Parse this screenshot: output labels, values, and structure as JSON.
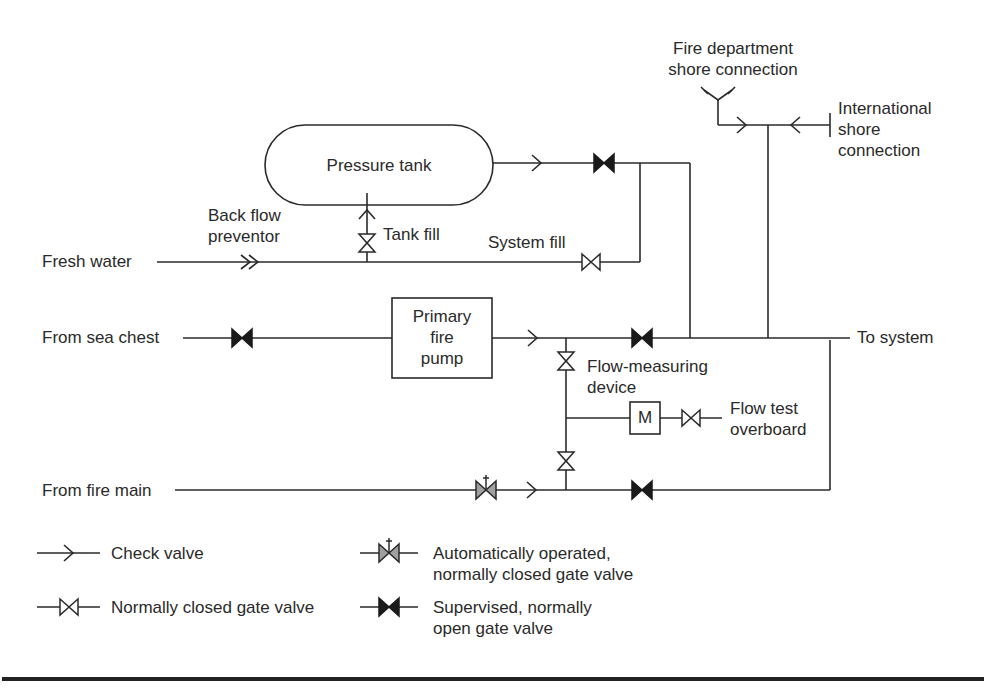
{
  "diagram": {
    "type": "piping-schematic",
    "title": "",
    "colors": {
      "line": "#2a2a2a",
      "supervised_valve_fill": "#1a1a1a",
      "auto_valve_fill": "#a0a0a0",
      "background": "#ffffff"
    },
    "components": {
      "pressure_tank": "Pressure tank",
      "primary_fire_pump": "Primary\nfire\npump",
      "meter": "M"
    },
    "labels": {
      "fire_dept_shore": "Fire department\nshore connection",
      "international_shore": "International\nshore\nconnection",
      "back_flow_preventor": "Back flow\npreventor",
      "tank_fill": "Tank fill",
      "system_fill": "System fill",
      "fresh_water": "Fresh water",
      "from_sea_chest": "From sea chest",
      "to_system": "To system",
      "flow_measuring_device": "Flow-measuring\ndevice",
      "flow_test_overboard": "Flow test\noverboard",
      "from_fire_main": "From fire main"
    },
    "legend": [
      {
        "icon": "check-valve-icon",
        "label": "Check valve"
      },
      {
        "icon": "auto-gate-valve-icon",
        "label": "Automatically operated,\nnormally closed gate valve"
      },
      {
        "icon": "closed-gate-valve-icon",
        "label": "Normally closed gate valve"
      },
      {
        "icon": "supervised-gate-valve-icon",
        "label": "Supervised, normally\nopen gate valve"
      }
    ],
    "nodes": [
      "Fresh water",
      "Back flow preventor",
      "Tank fill valve",
      "Pressure tank",
      "System fill valve",
      "From sea chest",
      "Primary fire pump",
      "Flow-measuring device",
      "Flow test overboard",
      "From fire main",
      "Fire department shore connection",
      "International shore connection",
      "To system"
    ],
    "edges": [
      {
        "from": "Fresh water",
        "to": "Back flow preventor"
      },
      {
        "from": "Back flow preventor",
        "to": "Tank fill valve"
      },
      {
        "from": "Tank fill valve",
        "to": "Pressure tank"
      },
      {
        "from": "Back flow preventor",
        "to": "System fill valve"
      },
      {
        "from": "Pressure tank",
        "to": "To system",
        "via": "check valve, supervised valve"
      },
      {
        "from": "System fill valve",
        "to": "To system"
      },
      {
        "from": "From sea chest",
        "to": "Primary fire pump",
        "via": "supervised valve"
      },
      {
        "from": "Primary fire pump",
        "to": "To system",
        "via": "check valve, supervised valve"
      },
      {
        "from": "Primary fire pump",
        "to": "Flow-measuring device",
        "via": "closed gate valve"
      },
      {
        "from": "Flow-measuring device",
        "to": "Flow test overboard",
        "via": "closed gate valve"
      },
      {
        "from": "From fire main",
        "to": "To system",
        "via": "auto valve, check valve, supervised valve"
      },
      {
        "from": "Fire department shore connection",
        "to": "To system",
        "via": "check valve"
      },
      {
        "from": "International shore connection",
        "to": "To system",
        "via": "check valve"
      }
    ]
  }
}
